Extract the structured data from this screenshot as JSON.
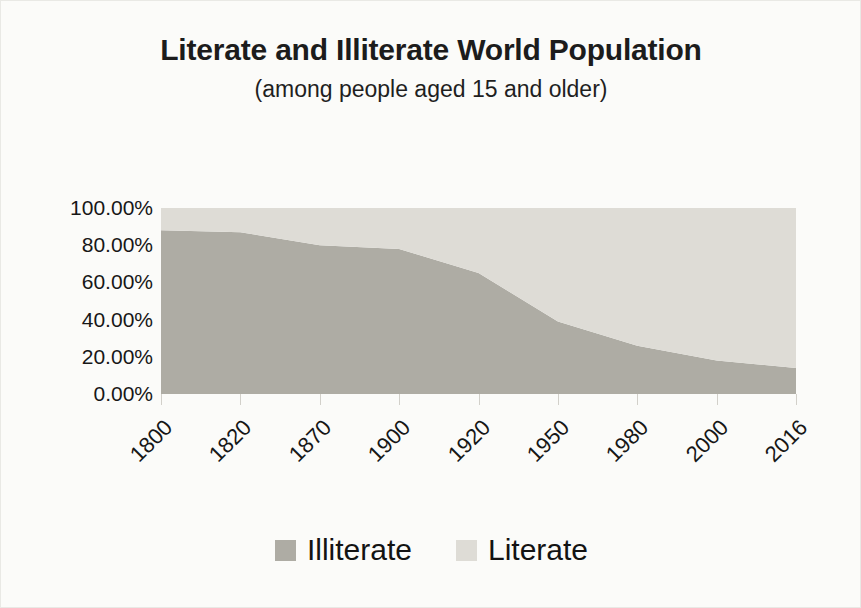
{
  "chart_data": {
    "type": "area",
    "title": "Literate and Illiterate World Population",
    "subtitle": "(among people aged 15 and older)",
    "xlabel": "",
    "ylabel": "",
    "stacked": true,
    "grid": false,
    "legend_position": "bottom",
    "ylim": [
      0,
      100
    ],
    "ytick_labels": [
      "100.00%",
      "80.00%",
      "60.00%",
      "40.00%",
      "20.00%",
      "0.00%"
    ],
    "ytick_values": [
      100,
      80,
      60,
      40,
      20,
      0
    ],
    "categories": [
      "1800",
      "1820",
      "1870",
      "1900",
      "1920",
      "1950",
      "1980",
      "2000",
      "2016"
    ],
    "series": [
      {
        "name": "Illiterate",
        "color": "#aeaca4",
        "values": [
          88,
          87,
          80,
          78,
          65,
          39,
          26,
          18,
          14
        ]
      },
      {
        "name": "Literate",
        "color": "#dedcd6",
        "values": [
          12,
          13,
          20,
          22,
          35,
          61,
          74,
          82,
          86
        ]
      }
    ]
  },
  "legend": {
    "items": [
      {
        "label": "Illiterate",
        "color": "#aeaca4"
      },
      {
        "label": "Literate",
        "color": "#dedcd6"
      }
    ]
  }
}
